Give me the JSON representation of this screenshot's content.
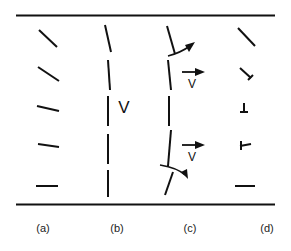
{
  "diagram": {
    "stroke_color": "#111111",
    "panels": [
      {
        "id": "a",
        "label": "(a)"
      },
      {
        "id": "b",
        "label": "(b)",
        "velocity_label": "V"
      },
      {
        "id": "c",
        "label": "(c)",
        "velocity_labels": [
          "V",
          "V"
        ]
      },
      {
        "id": "d",
        "label": "(d)"
      }
    ]
  }
}
